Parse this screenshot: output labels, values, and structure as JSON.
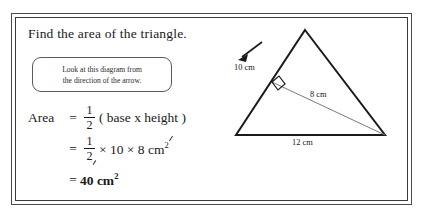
{
  "page": {
    "background_color": "#ffffff",
    "frame_color": "#4a4a4a"
  },
  "problem": {
    "heading": "Find the area of the triangle.",
    "callout": {
      "line1": "Look at this diagram from",
      "line2": "the direction of the arrow."
    }
  },
  "solution": {
    "line1": {
      "label": "Area",
      "equals": "=",
      "fraction_numerator": "1",
      "fraction_denominator": "2",
      "expression": "( base x height )"
    },
    "line2": {
      "label": "",
      "equals": "=",
      "fraction_numerator": "1",
      "fraction_denominator": "2",
      "expression_before": "× 10 × 8",
      "unit": "cm",
      "unit_exponent": "2"
    },
    "line3": {
      "label": "",
      "equals": "=",
      "answer": "40",
      "unit": "cm",
      "unit_exponent": "2"
    }
  },
  "diagram": {
    "type": "geometry-triangle",
    "stroke_color": "#1a1a1a",
    "altitude_color": "#6a6a6a",
    "labels": {
      "slant_side": "10 cm",
      "altitude": "8 cm",
      "base": "12 cm"
    },
    "annotations": {
      "right_angle_marker": "right-angle",
      "arrow_direction": "down-left"
    },
    "vertices": {
      "apex": [
        81,
        10
      ],
      "bottom_left": [
        12,
        115
      ],
      "bottom_right": [
        161,
        115
      ]
    },
    "altitude_foot": [
      48,
      62
    ]
  }
}
